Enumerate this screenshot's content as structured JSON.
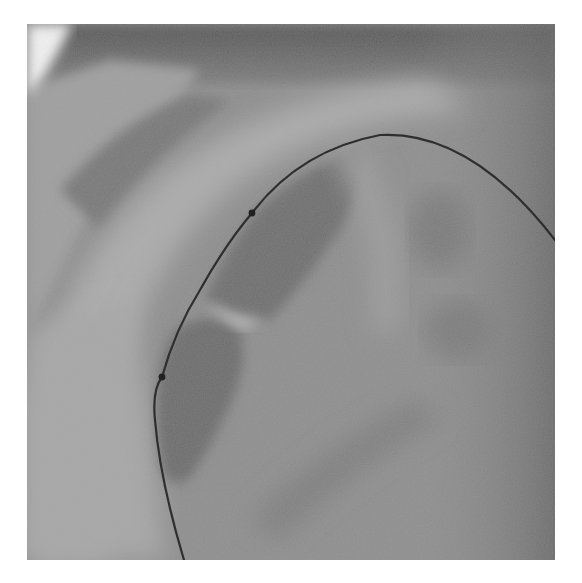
{
  "image": {
    "type": "fluoroscopy-xray",
    "grayscale": true,
    "frame": {
      "x": 27,
      "y": 24,
      "width": 528,
      "height": 536
    },
    "colors": {
      "background": "#ffffff",
      "base_tissue": "#8a8a8a",
      "light_region": "#a9a9a9",
      "bright_corner": "#f2f2f2",
      "dark_top_band": "#5e5e5e",
      "dark_lumen": "#6e6e6e",
      "right_edge_dark": "#6a6a6a",
      "wire": "#2e2e2e",
      "marker": "#222222"
    },
    "guidewire": {
      "markers": [
        {
          "label": "marker-1",
          "x": 252,
          "y": 213
        },
        {
          "label": "marker-2",
          "x": 162,
          "y": 377
        }
      ]
    }
  }
}
